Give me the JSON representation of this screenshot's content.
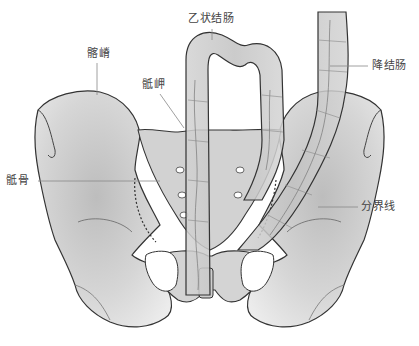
{
  "diagram": {
    "colors": {
      "bone_fill": "#dcdcdc",
      "bone_fill_dark": "#c4c4c4",
      "bowel_fill": "#c8c8c8",
      "outline": "#333333",
      "leader_line": "#888888",
      "label_text": "#444444",
      "background": "#ffffff"
    },
    "labels": [
      {
        "id": "sigmoid-colon",
        "text": "乙状结肠"
      },
      {
        "id": "iliac-crest",
        "text": "髂嵴"
      },
      {
        "id": "sacral-promontory",
        "text": "骶岬"
      },
      {
        "id": "descending-colon",
        "text": "降结肠"
      },
      {
        "id": "sacrum",
        "text": "骶骨"
      },
      {
        "id": "linea-terminalis",
        "text": "分界线"
      }
    ]
  }
}
